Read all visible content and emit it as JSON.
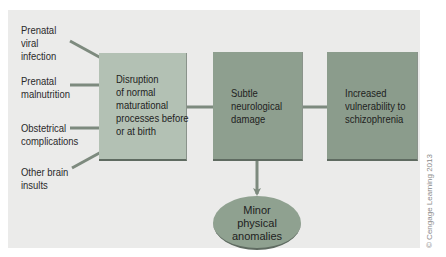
{
  "diagram": {
    "causes": [
      {
        "lines": [
          "Prenatal",
          "viral",
          "infection"
        ]
      },
      {
        "lines": [
          "Prenatal",
          "malnutrition"
        ]
      },
      {
        "lines": [
          "Obstetrical",
          "complications"
        ]
      },
      {
        "lines": [
          "Other brain",
          "insults"
        ]
      }
    ],
    "boxes": [
      {
        "lines": [
          "Disruption",
          "of normal",
          "maturational",
          "processes before",
          "or at birth"
        ]
      },
      {
        "lines": [
          "Subtle",
          "neurological",
          "damage"
        ]
      },
      {
        "lines": [
          "Increased",
          "vulnerability to",
          "schizophrenia"
        ]
      }
    ],
    "ellipse": {
      "lines": [
        "Minor",
        "physical",
        "anomalies"
      ]
    },
    "credit": "© Cengage Learning 2013",
    "colors": {
      "panel_bg": "#ebebea",
      "box1": "#b3c1b4",
      "box2": "#8e9f8f",
      "box3": "#8b9c8c",
      "ellipse": "#8fa190",
      "arrow": "#7d8a7e"
    }
  }
}
